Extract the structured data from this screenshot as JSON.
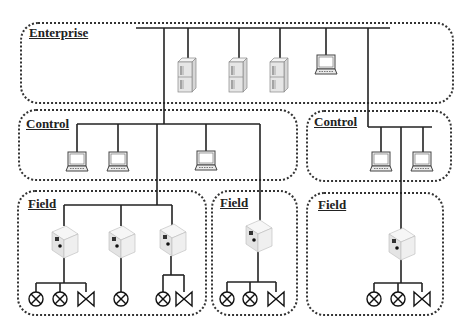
{
  "diagram": {
    "type": "industrial-network-hierarchy",
    "zones": [
      {
        "id": "enterprise",
        "label": "Enterprise",
        "devices": [
          "server",
          "server",
          "server",
          "laptop"
        ]
      },
      {
        "id": "control-left",
        "label": "Control",
        "devices": [
          "laptop",
          "laptop",
          "laptop"
        ]
      },
      {
        "id": "control-right",
        "label": "Control",
        "devices": [
          "laptop",
          "laptop"
        ]
      },
      {
        "id": "field-left",
        "label": "Field",
        "devices": [
          "plc",
          "plc",
          "plc"
        ],
        "actuators": [
          "lamp",
          "lamp",
          "valve",
          "lamp",
          "lamp",
          "valve"
        ]
      },
      {
        "id": "field-middle",
        "label": "Field",
        "devices": [
          "plc"
        ],
        "actuators": [
          "lamp",
          "lamp",
          "valve"
        ]
      },
      {
        "id": "field-right",
        "label": "Field",
        "devices": [
          "plc"
        ],
        "actuators": [
          "lamp",
          "lamp",
          "valve"
        ]
      }
    ],
    "colors": {
      "line": "#222222",
      "border": "#333333",
      "device_fill": "#e8e8e8",
      "device_stroke": "#777777"
    }
  }
}
